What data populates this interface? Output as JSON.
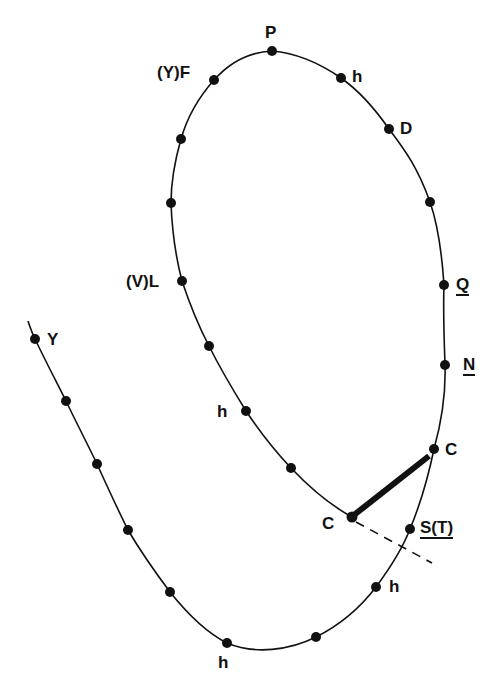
{
  "diagram": {
    "colors": {
      "ink": "#111111",
      "background": "#ffffff"
    },
    "labels": {
      "P": "P",
      "h_top": "h",
      "D": "D",
      "Q": "Q",
      "N": "N",
      "C_upper": "C",
      "C_lower": "C",
      "S_T": "S(T)",
      "h_lower_right": "h",
      "h_bottom": "h",
      "h_inner_left": "h",
      "V_L": "(V)L",
      "Y_F": "(Y)F",
      "Y_tail": "Y"
    },
    "underlined_labels": [
      "Q",
      "N",
      "S(T)"
    ],
    "loop_points": [
      {
        "x": 272,
        "y": 51,
        "label": "P"
      },
      {
        "x": 341,
        "y": 78,
        "label": "h"
      },
      {
        "x": 389,
        "y": 129,
        "label": "D"
      },
      {
        "x": 430,
        "y": 202,
        "label": ""
      },
      {
        "x": 444,
        "y": 285,
        "label": "Q"
      },
      {
        "x": 445,
        "y": 365,
        "label": "N"
      },
      {
        "x": 434,
        "y": 449,
        "label": "C"
      },
      {
        "x": 352,
        "y": 517,
        "label": "C"
      },
      {
        "x": 291,
        "y": 468,
        "label": ""
      },
      {
        "x": 246,
        "y": 411,
        "label": "h"
      },
      {
        "x": 209,
        "y": 346,
        "label": ""
      },
      {
        "x": 182,
        "y": 281,
        "label": "(V)L"
      },
      {
        "x": 171,
        "y": 203,
        "label": ""
      },
      {
        "x": 181,
        "y": 139,
        "label": ""
      },
      {
        "x": 214,
        "y": 80,
        "label": "(Y)F"
      }
    ],
    "tail_points": [
      {
        "x": 35,
        "y": 339,
        "label": "Y"
      },
      {
        "x": 66,
        "y": 401,
        "label": ""
      },
      {
        "x": 97,
        "y": 464,
        "label": ""
      },
      {
        "x": 128,
        "y": 530,
        "label": ""
      },
      {
        "x": 170,
        "y": 592,
        "label": ""
      },
      {
        "x": 227,
        "y": 643,
        "label": "h"
      },
      {
        "x": 316,
        "y": 637,
        "label": ""
      },
      {
        "x": 376,
        "y": 587,
        "label": "h"
      },
      {
        "x": 410,
        "y": 529,
        "label": "S(T)"
      }
    ],
    "connections": {
      "thick_bar": {
        "from": "C_lower",
        "to": "C_upper"
      },
      "dashed_line": {
        "from": "C_lower",
        "to_x": 432,
        "to_y": 563
      }
    }
  }
}
